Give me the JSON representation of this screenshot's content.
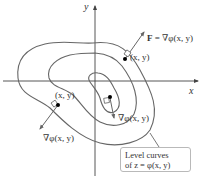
{
  "figure": {
    "axes": {
      "x_label": "x",
      "y_label": "y"
    },
    "points": [
      {
        "id": "top-right",
        "point_label": "(x, y)",
        "vector_label_prefix": "F",
        "vector_label_eq": " = ",
        "vector_label": "∇φ(x, y)"
      },
      {
        "id": "left",
        "point_label": "(x, y)",
        "vector_label": "∇φ(x, y)"
      },
      {
        "id": "center",
        "vector_label": "∇φ(x, y)"
      }
    ],
    "callout": {
      "line1": "Level curves",
      "line2": "of z = φ(x, y)"
    },
    "colors": {
      "curve": "#666666",
      "axis": "#444444",
      "vector": "#555555",
      "point": "#000000",
      "callout_border": "#b9b9b9"
    }
  }
}
